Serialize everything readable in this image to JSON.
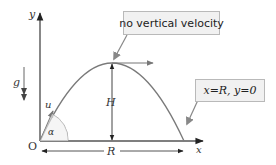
{
  "diagram": {
    "axes": {
      "x_label": "x",
      "y_label": "y",
      "origin_label": "O"
    },
    "labels": {
      "gravity": "g",
      "initial_velocity": "u",
      "angle": "α",
      "max_height": "H",
      "range": "R"
    },
    "callouts": {
      "apex": "no vertical velocity",
      "landing": "x=R, y=0"
    },
    "colors": {
      "curve": "#7a7a7a",
      "axes": "#555555",
      "callout_bg": "#f1f1f1",
      "callout_border": "#b9b9b9"
    }
  }
}
